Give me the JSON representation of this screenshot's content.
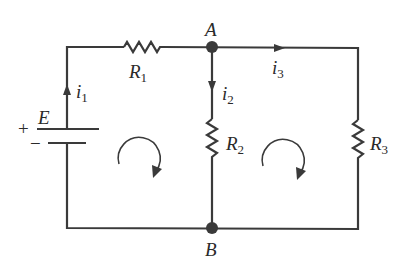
{
  "diagram": {
    "type": "circuit",
    "colors": {
      "wire": "#3a3a3a",
      "node": "#2a2a2a",
      "text": "#2a2a2a",
      "background": "#ffffff"
    },
    "source": {
      "label": "E",
      "plus": "+",
      "minus": "−"
    },
    "nodes": [
      {
        "id": "A",
        "label": "A"
      },
      {
        "id": "B",
        "label": "B"
      }
    ],
    "resistors": [
      {
        "id": "R1",
        "label": "R",
        "sub": "1"
      },
      {
        "id": "R2",
        "label": "R",
        "sub": "2"
      },
      {
        "id": "R3",
        "label": "R",
        "sub": "3"
      }
    ],
    "currents": [
      {
        "id": "i1",
        "label": "i",
        "sub": "1",
        "direction": "up"
      },
      {
        "id": "i2",
        "label": "i",
        "sub": "2",
        "direction": "down"
      },
      {
        "id": "i3",
        "label": "i",
        "sub": "3",
        "direction": "right"
      }
    ],
    "loops": [
      {
        "id": "loop1",
        "direction": "clockwise"
      },
      {
        "id": "loop2",
        "direction": "clockwise"
      }
    ]
  }
}
